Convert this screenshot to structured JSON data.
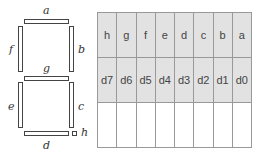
{
  "display": {
    "segments": [
      {
        "id": "a",
        "label": "a"
      },
      {
        "id": "b",
        "label": "b"
      },
      {
        "id": "c",
        "label": "c"
      },
      {
        "id": "d",
        "label": "d"
      },
      {
        "id": "e",
        "label": "e"
      },
      {
        "id": "f",
        "label": "f"
      },
      {
        "id": "g",
        "label": "g"
      },
      {
        "id": "h",
        "label": "h"
      }
    ]
  },
  "table": {
    "segment_row": [
      "h",
      "g",
      "f",
      "e",
      "d",
      "c",
      "b",
      "a"
    ],
    "bit_row": [
      "d7",
      "d6",
      "d5",
      "d4",
      "d3",
      "d2",
      "d1",
      "d0"
    ],
    "empty_row": [
      "",
      "",
      "",
      "",
      "",
      "",
      "",
      ""
    ]
  },
  "colors": {
    "shaded": "#e2e2e2",
    "border": "#999999"
  }
}
